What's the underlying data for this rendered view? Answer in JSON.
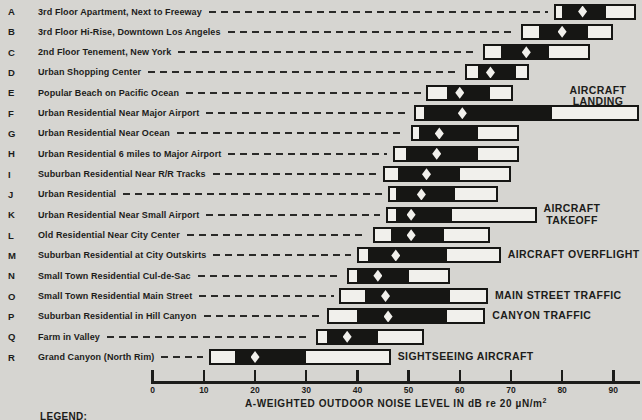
{
  "colors": {
    "paper": "#d6d5d1",
    "ink": "#1c1c1a",
    "bar_black": "#161614",
    "bar_white": "#f1f0ec"
  },
  "legend_label": "LEGEND:",
  "chart_data": {
    "type": "range-bar",
    "orientation": "horizontal",
    "marker": "white-diamond",
    "xlabel_main": "A-WEIGHTED OUTDOOR NOISE LEVEL IN dB re 20 µN/m",
    "xlabel_sup": "2",
    "x_ticks": [
      0,
      10,
      20,
      30,
      40,
      50,
      60,
      70,
      80,
      90
    ],
    "xlim": [
      0,
      95
    ],
    "grid": false,
    "rows": [
      {
        "key": "A",
        "label": "3rd Floor Apartment, Next to Freeway",
        "range": [
          78.5,
          94.5
        ],
        "core": [
          80,
          88.5
        ],
        "marker": 84
      },
      {
        "key": "B",
        "label": "3rd Floor Hi-Rise, Downtown Los Angeles",
        "range": [
          72,
          90
        ],
        "core": [
          75.5,
          85
        ],
        "marker": 80
      },
      {
        "key": "C",
        "label": "2nd Floor Tenement, New York",
        "range": [
          64.5,
          85.5
        ],
        "core": [
          68,
          77.5
        ],
        "marker": 73
      },
      {
        "key": "D",
        "label": "Urban Shopping Center",
        "range": [
          61,
          73.5
        ],
        "core": [
          63.5,
          71
        ],
        "marker": 66
      },
      {
        "key": "E",
        "label": "Popular Beach on Pacific Ocean",
        "range": [
          53.5,
          70.5
        ],
        "core": [
          57.5,
          66
        ],
        "marker": 60
      },
      {
        "key": "F",
        "label": "Urban Residential Near Major Airport",
        "range": [
          51,
          95
        ],
        "core": [
          53,
          78
        ],
        "marker": 60.5,
        "annotation": {
          "lines": [
            "AIRCRAFT",
            "LANDING"
          ],
          "placement": "above-right"
        }
      },
      {
        "key": "G",
        "label": "Urban Residential Near Ocean",
        "range": [
          50.5,
          71.5
        ],
        "core": [
          52,
          63.5
        ],
        "marker": 56
      },
      {
        "key": "H",
        "label": "Urban Residential 6 miles to Major Airport",
        "range": [
          47,
          71.5
        ],
        "core": [
          49.5,
          63.5
        ],
        "marker": 55.5
      },
      {
        "key": "I",
        "label": "Suburban Residential Near R/R Tracks",
        "range": [
          45,
          70
        ],
        "core": [
          48,
          60
        ],
        "marker": 53.5
      },
      {
        "key": "J",
        "label": "Urban Residential",
        "range": [
          46,
          67.5
        ],
        "core": [
          47.5,
          59
        ],
        "marker": 52.5
      },
      {
        "key": "K",
        "label": "Urban Residential Near Small Airport",
        "range": [
          45.5,
          75
        ],
        "core": [
          47.5,
          58.5
        ],
        "marker": 50.5,
        "annotation": {
          "lines": [
            "AIRCRAFT",
            "TAKEOFF"
          ],
          "placement": "right-stack"
        }
      },
      {
        "key": "L",
        "label": "Old Residential Near City Center",
        "range": [
          43,
          66
        ],
        "core": [
          46.5,
          57
        ],
        "marker": 50.5
      },
      {
        "key": "M",
        "label": "Suburban Residential at City Outskirts",
        "range": [
          40,
          68
        ],
        "core": [
          42,
          57.5
        ],
        "marker": 47.5,
        "annotation": {
          "lines": [
            "AIRCRAFT OVERFLIGHT"
          ],
          "placement": "right"
        }
      },
      {
        "key": "N",
        "label": "Small Town Residential Cul-de-Sac",
        "range": [
          38,
          58
        ],
        "core": [
          40,
          50
        ],
        "marker": 44
      },
      {
        "key": "O",
        "label": "Small Town Residential Main Street",
        "range": [
          36.5,
          65.5
        ],
        "core": [
          41.5,
          58
        ],
        "marker": 45.5,
        "annotation": {
          "lines": [
            "MAIN STREET TRAFFIC"
          ],
          "placement": "right"
        }
      },
      {
        "key": "P",
        "label": "Suburban Residential in Hill Canyon",
        "range": [
          34,
          65
        ],
        "core": [
          40,
          57.5
        ],
        "marker": 46,
        "annotation": {
          "lines": [
            "CANYON TRAFFIC"
          ],
          "placement": "right"
        }
      },
      {
        "key": "Q",
        "label": "Farm in Valley",
        "range": [
          32,
          53
        ],
        "core": [
          34,
          44
        ],
        "marker": 38
      },
      {
        "key": "R",
        "label": "Grand Canyon (North Rim)",
        "range": [
          11,
          46.5
        ],
        "core": [
          16,
          30
        ],
        "marker": 20,
        "annotation": {
          "lines": [
            "SIGHTSEEING AIRCRAFT"
          ],
          "placement": "right"
        }
      }
    ]
  }
}
